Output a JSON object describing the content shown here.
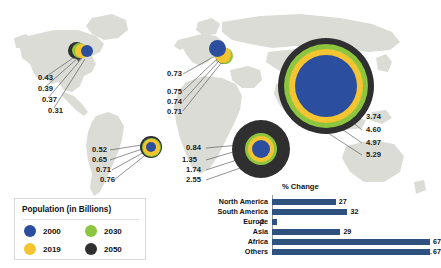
{
  "legend": {
    "title": "Population (in Billions)",
    "items": [
      {
        "label": "2000",
        "color": "#2b4f9e"
      },
      {
        "label": "2030",
        "color": "#8cc63f"
      },
      {
        "label": "2019",
        "color": "#f5c431"
      },
      {
        "label": "2050",
        "color": "#2f2f2f"
      }
    ]
  },
  "regions": [
    {
      "name": "North America",
      "values": [
        {
          "label": "0.43",
          "series": "2050"
        },
        {
          "label": "0.39",
          "series": "2030"
        },
        {
          "label": "0.37",
          "series": "2019"
        },
        {
          "label": "0.31",
          "series": "2000"
        }
      ]
    },
    {
      "name": "Europe",
      "values": [
        {
          "label": "0.73",
          "series": "2000"
        },
        {
          "label": "0.75",
          "series": "2019"
        },
        {
          "label": "0.74",
          "series": "2030"
        },
        {
          "label": "0.71",
          "series": "2050"
        }
      ]
    },
    {
      "name": "South America",
      "values": [
        {
          "label": "0.52",
          "series": "2000"
        },
        {
          "label": "0.65",
          "series": "2019"
        },
        {
          "label": "0.71",
          "series": "2030"
        },
        {
          "label": "0.76",
          "series": "2050"
        }
      ]
    },
    {
      "name": "Africa",
      "values": [
        {
          "label": "0.84",
          "series": "2000"
        },
        {
          "label": "1.35",
          "series": "2019"
        },
        {
          "label": "1.74",
          "series": "2030"
        },
        {
          "label": "2.55",
          "series": "2050"
        }
      ]
    },
    {
      "name": "Asia",
      "values": [
        {
          "label": "3.74",
          "series": "2000"
        },
        {
          "label": "4.60",
          "series": "2019"
        },
        {
          "label": "4.97",
          "series": "2030"
        },
        {
          "label": "5.29",
          "series": "2050"
        }
      ]
    }
  ],
  "chart_data": {
    "type": "bar",
    "orientation": "horizontal",
    "title": "% Change",
    "xlabel": "",
    "ylabel": "",
    "categories": [
      "North America",
      "South America",
      "Europe",
      "Asia",
      "Africa",
      "Others"
    ],
    "values": [
      27,
      32,
      -2,
      29,
      67,
      67
    ],
    "value_labels": [
      "27",
      "32",
      "-2",
      "29",
      "67",
      "67"
    ],
    "xlim": [
      -2,
      67
    ],
    "grid": false,
    "legend": false,
    "bar_color": "#2e5180"
  },
  "colors": {
    "map_land": "#dcdcd6",
    "background": "#ffffff",
    "bar": "#2e5180",
    "c2000": "#2b4f9e",
    "c2019": "#f5c431",
    "c2030": "#8cc63f",
    "c2050": "#2f2f2f"
  }
}
